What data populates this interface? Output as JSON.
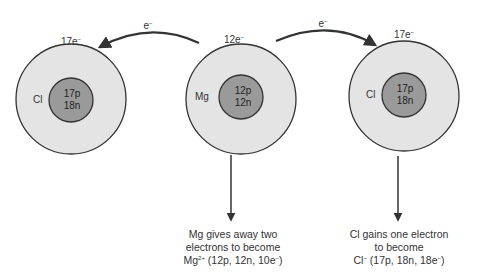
{
  "colors": {
    "outer_shell": "#e4e4e4",
    "nucleus": "#9a9a9a",
    "stroke": "#333333",
    "background": "#ffffff"
  },
  "atoms": [
    {
      "id": "cl-left",
      "symbol": "Cl",
      "shell_label": "17e",
      "shell_charge": "−",
      "nucleus_line1": "17p",
      "nucleus_line2": "18n"
    },
    {
      "id": "mg",
      "symbol": "Mg",
      "shell_label": "12e",
      "shell_charge": "−",
      "nucleus_line1": "12p",
      "nucleus_line2": "12n"
    },
    {
      "id": "cl-right",
      "symbol": "Cl",
      "shell_label": "17e",
      "shell_charge": "−",
      "nucleus_line1": "17p",
      "nucleus_line2": "18n"
    }
  ],
  "transfer_arrows": [
    {
      "direction": "mg-to-left-cl",
      "label": "e",
      "charge": "−"
    },
    {
      "direction": "mg-to-right-cl",
      "label": "e",
      "charge": "−"
    }
  ],
  "captions": {
    "mg": {
      "line1": "Mg gives away two",
      "line2": "electrons to become",
      "line3_symbol": "Mg",
      "line3_charge": "2+",
      "line3_rest": " (12p, 12n, 10e",
      "line3_e_charge": "−",
      "line3_close": ")"
    },
    "cl": {
      "line1": "Cl gains one electron",
      "line2": "to become",
      "line3_symbol": "Cl",
      "line3_charge": "−",
      "line3_rest": " (17p, 18n, 18e",
      "line3_e_charge": "−",
      "line3_close": ")"
    }
  }
}
